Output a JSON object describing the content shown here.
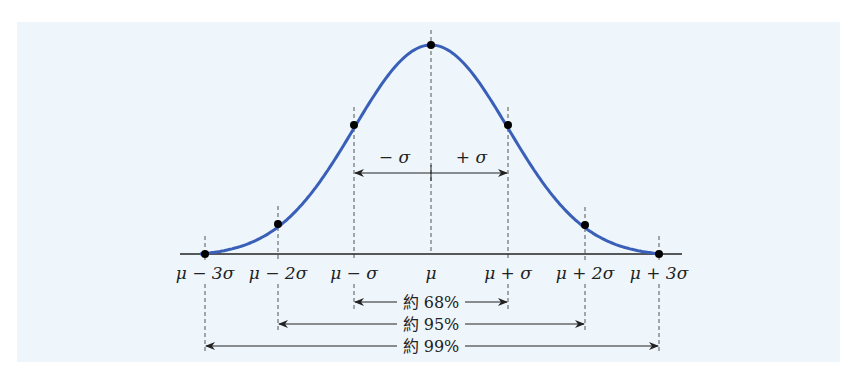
{
  "diagram": {
    "colors": {
      "background": "#eef6fb",
      "curve": "#3a5fb8",
      "axis": "#222222",
      "guides": "#555555",
      "points": "#000000"
    },
    "axis": {
      "x_start": 180,
      "x_end": 682,
      "y": 254
    },
    "mu_x": 431,
    "sigma_px": 77,
    "peak_y": 45,
    "points": [
      {
        "name": "mu-3sigma",
        "x": 205,
        "y": 254
      },
      {
        "name": "mu-2sigma",
        "x": 278,
        "y": 224
      },
      {
        "name": "mu-sigma",
        "x": 354,
        "y": 125
      },
      {
        "name": "mu",
        "x": 431,
        "y": 45
      },
      {
        "name": "mu+sigma",
        "x": 508,
        "y": 125
      },
      {
        "name": "mu+2sigma",
        "x": 585,
        "y": 225
      },
      {
        "name": "mu+3sigma",
        "x": 659,
        "y": 254
      }
    ],
    "tick_labels": [
      {
        "x": 205,
        "text": "μ − 3σ"
      },
      {
        "x": 278,
        "text": "μ − 2σ"
      },
      {
        "x": 354,
        "text": "μ − σ"
      },
      {
        "x": 431,
        "text": "μ"
      },
      {
        "x": 508,
        "text": "μ + σ"
      },
      {
        "x": 585,
        "text": "μ + 2σ"
      },
      {
        "x": 659,
        "text": "μ + 3σ"
      }
    ],
    "sigma_arrow": {
      "y": 173,
      "minus_label": "− σ",
      "plus_label": "+ σ"
    },
    "ranges": [
      {
        "label": "約 68%",
        "y": 302,
        "x1": 354,
        "x2": 508
      },
      {
        "label": "約 95%",
        "y": 324,
        "x1": 278,
        "x2": 585
      },
      {
        "label": "約 99%",
        "y": 346,
        "x1": 205,
        "x2": 659
      }
    ]
  }
}
